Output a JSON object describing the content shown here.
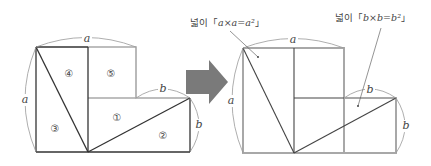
{
  "left_figure": {
    "labels": {
      "top": "a",
      "left": "a",
      "step_top": "b",
      "right": "b"
    },
    "regions": [
      "①",
      "②",
      "③",
      "④",
      "⑤"
    ]
  },
  "arrow": {
    "color": "#7a7a7a",
    "direction": "right"
  },
  "right_figure": {
    "labels": {
      "top": "a",
      "left": "a",
      "step_top": "b",
      "right": "b"
    },
    "annotation_a": {
      "prefix": "넓이「",
      "expr": "a×a=a²",
      "suffix": "」"
    },
    "annotation_b": {
      "prefix": "넓이「",
      "expr": "b×b=b²",
      "suffix": "」"
    }
  },
  "colors": {
    "line_dark": "#333333",
    "line_gray": "#a8a8a8",
    "arc": "#999999",
    "arrow": "#7a7a7a"
  }
}
